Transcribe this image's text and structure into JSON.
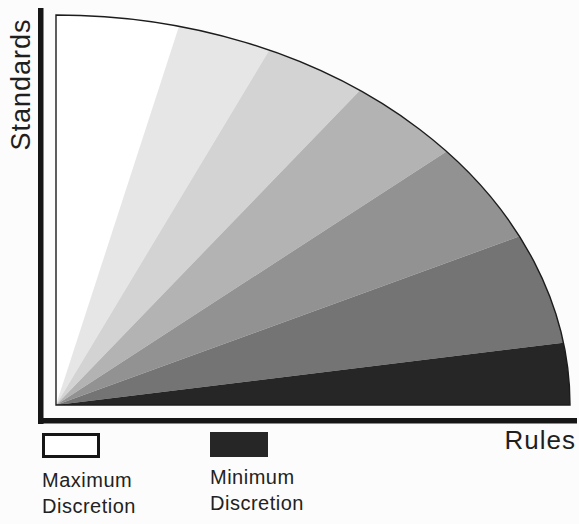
{
  "axes": {
    "y_label": "Standards",
    "x_label": "Rules",
    "color": "#161616"
  },
  "legend": {
    "items": [
      {
        "line1": "Maximum",
        "line2": "Discretion",
        "swatch_color": "#ffffff",
        "swatch_border": "#161616"
      },
      {
        "line1": "Minimum",
        "line2": "Discretion",
        "swatch_color": "#262626",
        "swatch_border": "#262626"
      }
    ]
  },
  "chart_data": {
    "type": "pie",
    "subtype": "quarter-fan",
    "title": "",
    "xlabel": "Rules",
    "ylabel": "Standards",
    "origin": "bottom-left",
    "angle_reference": "segment angles in degrees measured from the vertical Standards axis toward the horizontal Rules axis",
    "segments": [
      {
        "start_deg": 0,
        "end_deg": 18,
        "shade": "#ffffff"
      },
      {
        "start_deg": 18,
        "end_deg": 31,
        "shade": "#e6e6e6"
      },
      {
        "start_deg": 31,
        "end_deg": 44,
        "shade": "#d3d3d3"
      },
      {
        "start_deg": 44,
        "end_deg": 57,
        "shade": "#b3b3b3"
      },
      {
        "start_deg": 57,
        "end_deg": 70,
        "shade": "#929292"
      },
      {
        "start_deg": 70,
        "end_deg": 83,
        "shade": "#747474"
      },
      {
        "start_deg": 83,
        "end_deg": 90,
        "shade": "#262626"
      }
    ],
    "legend": [
      {
        "label": "Maximum Discretion",
        "color": "#ffffff"
      },
      {
        "label": "Minimum Discretion",
        "color": "#262626"
      }
    ],
    "outline_color": "#1c1c1c"
  }
}
